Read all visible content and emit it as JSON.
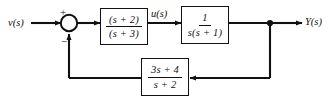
{
  "diagram": {
    "type": "control-system-block-diagram",
    "line_color": "#111111",
    "background": "#ffffff",
    "signals": {
      "input_label": "v(s)",
      "intermediate_label": "u(s)",
      "output_label": "Y(s)"
    },
    "summing_junction": {
      "name": "summing-junction",
      "shape": "circle",
      "input_sign": "+",
      "feedback_sign": "−"
    },
    "blocks": [
      {
        "id": "forward-1",
        "name": "forward-block-1",
        "numerator": "(s + 2)",
        "denominator": "(s + 3)",
        "path": "forward"
      },
      {
        "id": "forward-2",
        "name": "forward-block-2",
        "numerator": "1",
        "denominator": "s(s + 1)",
        "path": "forward"
      },
      {
        "id": "feedback",
        "name": "feedback-block",
        "numerator": "3s + 4",
        "denominator": "s + 2",
        "path": "feedback"
      }
    ],
    "topology": {
      "forward_path": "v(s) → summing junction → (s + 2)/(s + 3) → u(s) → 1/[s(s + 1)] → Y(s)",
      "feedback_path": "Y(s) takeoff → (3s + 4)/(s + 2) → summing junction (negative)"
    }
  }
}
